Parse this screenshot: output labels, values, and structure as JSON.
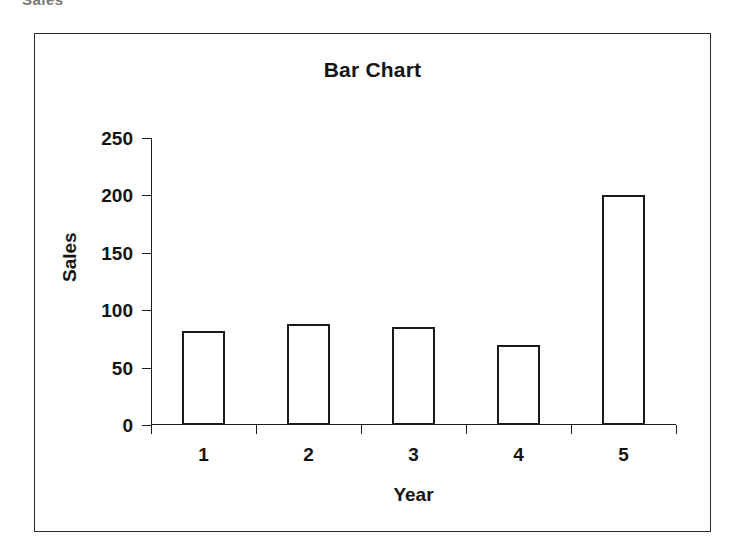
{
  "artifact": {
    "cut_off_text": "Sales"
  },
  "chart_data": {
    "type": "bar",
    "title": "Bar Chart",
    "xlabel": "Year",
    "ylabel": "Sales",
    "categories": [
      "1",
      "2",
      "3",
      "4",
      "5"
    ],
    "values": [
      82,
      88,
      85,
      70,
      200
    ],
    "ylim": [
      0,
      250
    ],
    "yticks": [
      0,
      50,
      100,
      150,
      200,
      250
    ],
    "ytick_labels": [
      "0",
      "50",
      "100",
      "150",
      "200",
      "250"
    ],
    "grid": false,
    "legend": null,
    "series": [
      {
        "name": "Sales",
        "values": [
          82,
          88,
          85,
          70,
          200
        ]
      }
    ],
    "style": {
      "bar_fill": "#ffffff",
      "bar_edge": "#1a1a1a",
      "axis_color": "#1d1d1d",
      "text_color": "#141414",
      "background": "#ffffff",
      "frame_border": "#2b2b2b"
    }
  }
}
